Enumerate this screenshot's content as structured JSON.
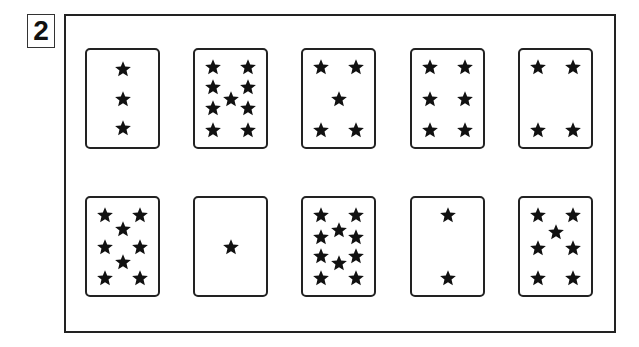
{
  "problem_number": "2",
  "cards": [
    {
      "count": 3,
      "stars": [
        [
          50,
          20
        ],
        [
          50,
          50
        ],
        [
          50,
          80
        ]
      ]
    },
    {
      "count": 9,
      "stars": [
        [
          25,
          18
        ],
        [
          75,
          18
        ],
        [
          25,
          38
        ],
        [
          75,
          38
        ],
        [
          50,
          50
        ],
        [
          25,
          60
        ],
        [
          75,
          60
        ],
        [
          25,
          82
        ],
        [
          75,
          82
        ]
      ]
    },
    {
      "count": 5,
      "stars": [
        [
          25,
          18
        ],
        [
          75,
          18
        ],
        [
          50,
          50
        ],
        [
          25,
          82
        ],
        [
          75,
          82
        ]
      ]
    },
    {
      "count": 6,
      "stars": [
        [
          25,
          18
        ],
        [
          75,
          18
        ],
        [
          25,
          50
        ],
        [
          75,
          50
        ],
        [
          25,
          82
        ],
        [
          75,
          82
        ]
      ]
    },
    {
      "count": 4,
      "stars": [
        [
          25,
          18
        ],
        [
          75,
          18
        ],
        [
          25,
          82
        ],
        [
          75,
          82
        ]
      ]
    },
    {
      "count": 8,
      "stars": [
        [
          25,
          18
        ],
        [
          75,
          18
        ],
        [
          50,
          32
        ],
        [
          25,
          50
        ],
        [
          75,
          50
        ],
        [
          50,
          66
        ],
        [
          25,
          82
        ],
        [
          75,
          82
        ]
      ]
    },
    {
      "count": 1,
      "stars": [
        [
          50,
          50
        ]
      ]
    },
    {
      "count": 10,
      "stars": [
        [
          25,
          18
        ],
        [
          75,
          18
        ],
        [
          50,
          33
        ],
        [
          25,
          40
        ],
        [
          75,
          40
        ],
        [
          25,
          60
        ],
        [
          75,
          60
        ],
        [
          50,
          67
        ],
        [
          25,
          82
        ],
        [
          75,
          82
        ]
      ]
    },
    {
      "count": 2,
      "stars": [
        [
          50,
          18
        ],
        [
          50,
          82
        ]
      ]
    },
    {
      "count": 7,
      "stars": [
        [
          25,
          18
        ],
        [
          75,
          18
        ],
        [
          50,
          35
        ],
        [
          25,
          52
        ],
        [
          75,
          52
        ],
        [
          25,
          82
        ],
        [
          75,
          82
        ]
      ]
    }
  ],
  "colors": {
    "ink": "#222222",
    "background": "#ffffff"
  }
}
